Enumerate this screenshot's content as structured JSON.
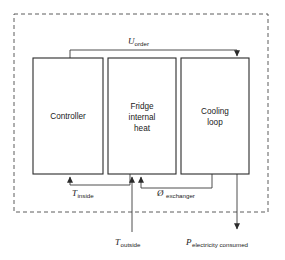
{
  "diagram": {
    "boundary": {
      "name": "system-boundary",
      "style": "dashed",
      "color": "#4a4a4a"
    },
    "blocks": [
      {
        "id": "controller",
        "label_lines": [
          "Controller"
        ],
        "x": 33,
        "y": 58,
        "w": 70,
        "h": 116
      },
      {
        "id": "fridge-internal-heat",
        "label_lines": [
          "Fridge",
          "internal",
          "heat"
        ],
        "x": 108,
        "y": 58,
        "w": 68,
        "h": 116
      },
      {
        "id": "cooling-loop",
        "label_lines": [
          "Cooling",
          "loop"
        ],
        "x": 181,
        "y": 58,
        "w": 68,
        "h": 116
      }
    ],
    "signals": [
      {
        "id": "u-order",
        "symbol": "U",
        "subscript": "order",
        "from": "controller",
        "to": "cooling-loop",
        "position": "top",
        "label_x": 138,
        "label_y": 44
      },
      {
        "id": "t-inside",
        "symbol": "T",
        "subscript": "inside",
        "from": "fridge-internal-heat",
        "to": "controller",
        "position": "bottom",
        "label_x": 80,
        "label_y": 196
      },
      {
        "id": "phi-exchanger",
        "symbol": "Ø",
        "subscript": "exchanger",
        "from": "cooling-loop",
        "to": "fridge-internal-heat",
        "position": "bottom",
        "label_x": 160,
        "label_y": 196
      },
      {
        "id": "t-outside",
        "symbol": "T",
        "subscript": "outside",
        "from": "environment",
        "to": "fridge-internal-heat",
        "position": "external-bottom",
        "label_x": 118,
        "label_y": 245
      },
      {
        "id": "p-electricity-consumed",
        "symbol": "P",
        "subscript": "electricity consumed",
        "from": "cooling-loop",
        "to": "environment",
        "position": "external-bottom",
        "label_x": 188,
        "label_y": 245
      }
    ],
    "colors": {
      "line": "#3a3a3a",
      "box_stroke": "#2b2b2b",
      "boundary_stroke": "#4a4a4a",
      "text": "#1a1a1a",
      "background": "#ffffff"
    }
  }
}
